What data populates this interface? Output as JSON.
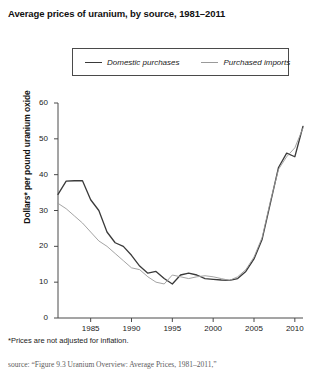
{
  "chart_data": {
    "type": "line",
    "title": "Average prices of uranium, by source, 1981–2011",
    "xlabel": "",
    "ylabel": "Dollars* per pound uranium oxide",
    "xlim": [
      1981,
      2011
    ],
    "ylim": [
      0,
      60
    ],
    "yticks": [
      0,
      10,
      20,
      30,
      40,
      50,
      60
    ],
    "xticks": [
      1985,
      1990,
      1995,
      2000,
      2005,
      2010
    ],
    "grid": false,
    "legend_position": "top-center",
    "x": [
      1981,
      1982,
      1983,
      1984,
      1985,
      1986,
      1987,
      1988,
      1989,
      1990,
      1991,
      1992,
      1993,
      1994,
      1995,
      1996,
      1997,
      1998,
      1999,
      2000,
      2001,
      2002,
      2003,
      2004,
      2005,
      2006,
      2007,
      2008,
      2009,
      2010,
      2011
    ],
    "series": [
      {
        "name": "Domestic purchases",
        "color": "#3a3a3a",
        "values": [
          34.5,
          38.2,
          38.3,
          38.3,
          33.0,
          30.0,
          24.0,
          21.0,
          20.0,
          17.5,
          14.5,
          12.5,
          13.0,
          11.0,
          9.5,
          12.0,
          12.5,
          12.0,
          11.0,
          10.8,
          10.6,
          10.5,
          11.0,
          13.0,
          16.5,
          22.0,
          32.0,
          42.0,
          46.0,
          45.0,
          53.5
        ]
      },
      {
        "name": "Purchased imports",
        "color": "#9a9a9a",
        "values": [
          32.0,
          30.5,
          28.5,
          26.5,
          24.0,
          21.5,
          20.0,
          18.0,
          16.0,
          14.0,
          13.5,
          11.5,
          10.0,
          9.5,
          12.0,
          11.5,
          11.0,
          11.5,
          11.8,
          11.5,
          11.0,
          10.5,
          11.5,
          13.5,
          17.0,
          22.5,
          32.5,
          41.5,
          45.0,
          47.5,
          53.0
        ]
      }
    ],
    "footnote": "*Prices are not adjusted for inflation.",
    "source": "source: “Figure 9.3 Uranium Overview: Average Prices, 1981–2011,”"
  },
  "legend": {
    "domestic_label": "Domestic purchases",
    "imports_label": "Purchased imports"
  },
  "axis": {
    "y_labels": [
      "60",
      "50",
      "40",
      "30",
      "20",
      "10",
      "0"
    ],
    "x_labels": [
      "1985",
      "1990",
      "1995",
      "2000",
      "2005",
      "2010"
    ]
  }
}
